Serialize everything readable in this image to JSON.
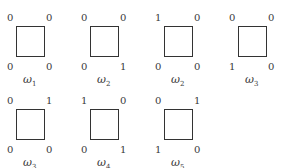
{
  "figures": [
    {
      "label": "ω",
      "sub": "1",
      "tl": "0",
      "tr": "0",
      "bl": "0",
      "br": "0"
    },
    {
      "label": "ω",
      "sub": "2",
      "tl": "0",
      "tr": "0",
      "bl": "0",
      "br": "1"
    },
    {
      "label": "ω",
      "sub": "2",
      "tl": "1",
      "tr": "0",
      "bl": "0",
      "br": "0"
    },
    {
      "label": "ω",
      "sub": "3",
      "tl": "0",
      "tr": "0",
      "bl": "1",
      "br": "0"
    },
    {
      "label": "ω",
      "sub": "3",
      "tl": "0",
      "tr": "1",
      "bl": "0",
      "br": "0"
    },
    {
      "label": "ω",
      "sub": "4",
      "tl": "1",
      "tr": "0",
      "bl": "0",
      "br": "1"
    },
    {
      "label": "ω",
      "sub": "5",
      "tl": "0",
      "tr": "1",
      "bl": "1",
      "br": "0"
    }
  ]
}
